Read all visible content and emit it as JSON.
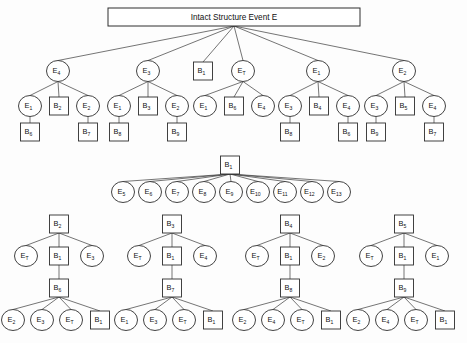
{
  "diagram": {
    "title": "Intact Structure Event E",
    "title_box": {
      "x": 108,
      "y": 8,
      "width": 252,
      "height": 18
    },
    "colors": {
      "background": "#fdfdfd",
      "node_fill": "#ffffff",
      "node_stroke": "#2e2e2e",
      "edge_stroke": "#3a3a3a",
      "text": "#111111"
    },
    "geometry": {
      "circle_rx": 11.5,
      "circle_ry": 10.5,
      "box_width": 19,
      "box_height": 18
    },
    "nodes": [
      {
        "id": "root",
        "shape": "box",
        "base": "E",
        "sub": "",
        "label": "Intact Structure Event E",
        "x": 234,
        "y": 17
      },
      {
        "id": "t1",
        "shape": "circle",
        "base": "E",
        "sub": "4",
        "x": 58,
        "y": 71
      },
      {
        "id": "t2",
        "shape": "circle",
        "base": "E",
        "sub": "3",
        "x": 148,
        "y": 71
      },
      {
        "id": "t3",
        "shape": "box",
        "base": "B",
        "sub": "1",
        "x": 203,
        "y": 71
      },
      {
        "id": "t4",
        "shape": "circle",
        "base": "E",
        "sub": "T",
        "x": 243,
        "y": 71
      },
      {
        "id": "t5",
        "shape": "circle",
        "base": "E",
        "sub": "1",
        "x": 318,
        "y": 71
      },
      {
        "id": "t6",
        "shape": "circle",
        "base": "E",
        "sub": "2",
        "x": 404,
        "y": 71
      },
      {
        "id": "a1",
        "shape": "circle",
        "base": "E",
        "sub": "1",
        "x": 30,
        "y": 106
      },
      {
        "id": "a2",
        "shape": "box",
        "base": "B",
        "sub": "2",
        "x": 59,
        "y": 106
      },
      {
        "id": "a3",
        "shape": "circle",
        "base": "E",
        "sub": "2",
        "x": 88,
        "y": 106
      },
      {
        "id": "a1c",
        "shape": "box",
        "base": "B",
        "sub": "6",
        "x": 30,
        "y": 132
      },
      {
        "id": "a3c",
        "shape": "box",
        "base": "B",
        "sub": "7",
        "x": 88,
        "y": 132
      },
      {
        "id": "b1",
        "shape": "circle",
        "base": "E",
        "sub": "1",
        "x": 119,
        "y": 106
      },
      {
        "id": "b2",
        "shape": "box",
        "base": "B",
        "sub": "3",
        "x": 148,
        "y": 106
      },
      {
        "id": "b3",
        "shape": "circle",
        "base": "E",
        "sub": "2",
        "x": 177,
        "y": 106
      },
      {
        "id": "b1c",
        "shape": "box",
        "base": "B",
        "sub": "8",
        "x": 119,
        "y": 132
      },
      {
        "id": "b3c",
        "shape": "box",
        "base": "B",
        "sub": "9",
        "x": 177,
        "y": 132
      },
      {
        "id": "c1",
        "shape": "circle",
        "base": "E",
        "sub": "1",
        "x": 205,
        "y": 106
      },
      {
        "id": "c2",
        "shape": "box",
        "base": "B",
        "sub": "6",
        "x": 234,
        "y": 106
      },
      {
        "id": "c3",
        "shape": "circle",
        "base": "E",
        "sub": "4",
        "x": 263,
        "y": 106
      },
      {
        "id": "d1",
        "shape": "circle",
        "base": "E",
        "sub": "3",
        "x": 290,
        "y": 106
      },
      {
        "id": "d2",
        "shape": "box",
        "base": "B",
        "sub": "4",
        "x": 319,
        "y": 106
      },
      {
        "id": "d3",
        "shape": "circle",
        "base": "E",
        "sub": "4",
        "x": 348,
        "y": 106
      },
      {
        "id": "d1c",
        "shape": "box",
        "base": "B",
        "sub": "8",
        "x": 290,
        "y": 132
      },
      {
        "id": "d3c",
        "shape": "box",
        "base": "B",
        "sub": "6",
        "x": 348,
        "y": 132
      },
      {
        "id": "f1",
        "shape": "circle",
        "base": "E",
        "sub": "3",
        "x": 376,
        "y": 106
      },
      {
        "id": "f2",
        "shape": "box",
        "base": "B",
        "sub": "5",
        "x": 405,
        "y": 106
      },
      {
        "id": "f3",
        "shape": "circle",
        "base": "E",
        "sub": "4",
        "x": 434,
        "y": 106
      },
      {
        "id": "f1c",
        "shape": "box",
        "base": "B",
        "sub": "9",
        "x": 376,
        "y": 132
      },
      {
        "id": "f3c",
        "shape": "box",
        "base": "B",
        "sub": "7",
        "x": 434,
        "y": 132
      },
      {
        "id": "m0",
        "shape": "box",
        "base": "B",
        "sub": "1",
        "x": 230,
        "y": 165
      },
      {
        "id": "m1",
        "shape": "circle",
        "base": "E",
        "sub": "5",
        "x": 123,
        "y": 192
      },
      {
        "id": "m2",
        "shape": "circle",
        "base": "E",
        "sub": "6",
        "x": 150,
        "y": 192
      },
      {
        "id": "m3",
        "shape": "circle",
        "base": "E",
        "sub": "7",
        "x": 177,
        "y": 192
      },
      {
        "id": "m4",
        "shape": "circle",
        "base": "E",
        "sub": "8",
        "x": 204,
        "y": 192
      },
      {
        "id": "m5",
        "shape": "circle",
        "base": "E",
        "sub": "9",
        "x": 231,
        "y": 192
      },
      {
        "id": "m6",
        "shape": "circle",
        "base": "E",
        "sub": "10",
        "x": 258,
        "y": 192
      },
      {
        "id": "m7",
        "shape": "circle",
        "base": "E",
        "sub": "11",
        "x": 285,
        "y": 192
      },
      {
        "id": "m8",
        "shape": "circle",
        "base": "E",
        "sub": "12",
        "x": 312,
        "y": 192
      },
      {
        "id": "m9",
        "shape": "circle",
        "base": "E",
        "sub": "13",
        "x": 339,
        "y": 192
      },
      {
        "id": "g1r",
        "shape": "box",
        "base": "B",
        "sub": "2",
        "x": 59,
        "y": 224
      },
      {
        "id": "g1a",
        "shape": "circle",
        "base": "E",
        "sub": "T",
        "x": 26,
        "y": 256
      },
      {
        "id": "g1b",
        "shape": "box",
        "base": "B",
        "sub": "1",
        "x": 59,
        "y": 256
      },
      {
        "id": "g1c",
        "shape": "circle",
        "base": "E",
        "sub": "3",
        "x": 92,
        "y": 256
      },
      {
        "id": "g1m",
        "shape": "box",
        "base": "B",
        "sub": "6",
        "x": 59,
        "y": 288
      },
      {
        "id": "g1l1",
        "shape": "circle",
        "base": "E",
        "sub": "2",
        "x": 13,
        "y": 320
      },
      {
        "id": "g1l2",
        "shape": "circle",
        "base": "E",
        "sub": "3",
        "x": 42,
        "y": 320
      },
      {
        "id": "g1l3",
        "shape": "circle",
        "base": "E",
        "sub": "T",
        "x": 71,
        "y": 320
      },
      {
        "id": "g1l4",
        "shape": "box",
        "base": "B",
        "sub": "1",
        "x": 100,
        "y": 320
      },
      {
        "id": "g2r",
        "shape": "box",
        "base": "B",
        "sub": "3",
        "x": 172,
        "y": 224
      },
      {
        "id": "g2a",
        "shape": "circle",
        "base": "E",
        "sub": "T",
        "x": 139,
        "y": 256
      },
      {
        "id": "g2b",
        "shape": "box",
        "base": "B",
        "sub": "1",
        "x": 172,
        "y": 256
      },
      {
        "id": "g2c",
        "shape": "circle",
        "base": "E",
        "sub": "4",
        "x": 205,
        "y": 256
      },
      {
        "id": "g2m",
        "shape": "box",
        "base": "B",
        "sub": "7",
        "x": 172,
        "y": 288
      },
      {
        "id": "g2l1",
        "shape": "circle",
        "base": "E",
        "sub": "1",
        "x": 126,
        "y": 320
      },
      {
        "id": "g2l2",
        "shape": "circle",
        "base": "E",
        "sub": "3",
        "x": 155,
        "y": 320
      },
      {
        "id": "g2l3",
        "shape": "circle",
        "base": "E",
        "sub": "T",
        "x": 184,
        "y": 320
      },
      {
        "id": "g2l4",
        "shape": "box",
        "base": "B",
        "sub": "1",
        "x": 213,
        "y": 320
      },
      {
        "id": "g3r",
        "shape": "box",
        "base": "B",
        "sub": "4",
        "x": 290,
        "y": 224
      },
      {
        "id": "g3a",
        "shape": "circle",
        "base": "E",
        "sub": "T",
        "x": 257,
        "y": 256
      },
      {
        "id": "g3b",
        "shape": "box",
        "base": "B",
        "sub": "1",
        "x": 290,
        "y": 256
      },
      {
        "id": "g3c",
        "shape": "circle",
        "base": "E",
        "sub": "2",
        "x": 323,
        "y": 256
      },
      {
        "id": "g3m",
        "shape": "box",
        "base": "B",
        "sub": "8",
        "x": 290,
        "y": 288
      },
      {
        "id": "g3l1",
        "shape": "circle",
        "base": "E",
        "sub": "2",
        "x": 244,
        "y": 320
      },
      {
        "id": "g3l2",
        "shape": "circle",
        "base": "E",
        "sub": "4",
        "x": 273,
        "y": 320
      },
      {
        "id": "g3l3",
        "shape": "circle",
        "base": "E",
        "sub": "T",
        "x": 302,
        "y": 320
      },
      {
        "id": "g3l4",
        "shape": "box",
        "base": "B",
        "sub": "1",
        "x": 331,
        "y": 320
      },
      {
        "id": "g4r",
        "shape": "box",
        "base": "B",
        "sub": "5",
        "x": 404,
        "y": 224
      },
      {
        "id": "g4a",
        "shape": "circle",
        "base": "E",
        "sub": "T",
        "x": 371,
        "y": 256
      },
      {
        "id": "g4b",
        "shape": "box",
        "base": "B",
        "sub": "1",
        "x": 404,
        "y": 256
      },
      {
        "id": "g4c",
        "shape": "circle",
        "base": "E",
        "sub": "1",
        "x": 437,
        "y": 256
      },
      {
        "id": "g4m",
        "shape": "box",
        "base": "B",
        "sub": "9",
        "x": 404,
        "y": 288
      },
      {
        "id": "g4l1",
        "shape": "circle",
        "base": "E",
        "sub": "2",
        "x": 358,
        "y": 320
      },
      {
        "id": "g4l2",
        "shape": "circle",
        "base": "E",
        "sub": "4",
        "x": 387,
        "y": 320
      },
      {
        "id": "g4l3",
        "shape": "circle",
        "base": "E",
        "sub": "T",
        "x": 416,
        "y": 320
      },
      {
        "id": "g4l4",
        "shape": "box",
        "base": "B",
        "sub": "1",
        "x": 445,
        "y": 320
      }
    ],
    "edges": [
      [
        "root",
        "t1"
      ],
      [
        "root",
        "t2"
      ],
      [
        "root",
        "t3"
      ],
      [
        "root",
        "t4"
      ],
      [
        "root",
        "t5"
      ],
      [
        "root",
        "t6"
      ],
      [
        "t1",
        "a1"
      ],
      [
        "t1",
        "a2"
      ],
      [
        "t1",
        "a3"
      ],
      [
        "a1",
        "a1c"
      ],
      [
        "a3",
        "a3c"
      ],
      [
        "t2",
        "b1"
      ],
      [
        "t2",
        "b2"
      ],
      [
        "t2",
        "b3"
      ],
      [
        "b1",
        "b1c"
      ],
      [
        "b3",
        "b3c"
      ],
      [
        "t4",
        "c1"
      ],
      [
        "t4",
        "c2"
      ],
      [
        "t4",
        "c3"
      ],
      [
        "t5",
        "d1"
      ],
      [
        "t5",
        "d2"
      ],
      [
        "t5",
        "d3"
      ],
      [
        "d1",
        "d1c"
      ],
      [
        "d3",
        "d3c"
      ],
      [
        "t6",
        "f1"
      ],
      [
        "t6",
        "f2"
      ],
      [
        "t6",
        "f3"
      ],
      [
        "f1",
        "f1c"
      ],
      [
        "f3",
        "f3c"
      ],
      [
        "m0",
        "m1"
      ],
      [
        "m0",
        "m2"
      ],
      [
        "m0",
        "m3"
      ],
      [
        "m0",
        "m4"
      ],
      [
        "m0",
        "m5"
      ],
      [
        "m0",
        "m6"
      ],
      [
        "m0",
        "m7"
      ],
      [
        "m0",
        "m8"
      ],
      [
        "m0",
        "m9"
      ],
      [
        "g1r",
        "g1a"
      ],
      [
        "g1r",
        "g1b"
      ],
      [
        "g1r",
        "g1c"
      ],
      [
        "g1b",
        "g1m"
      ],
      [
        "g1m",
        "g1l1"
      ],
      [
        "g1m",
        "g1l2"
      ],
      [
        "g1m",
        "g1l3"
      ],
      [
        "g1m",
        "g1l4"
      ],
      [
        "g2r",
        "g2a"
      ],
      [
        "g2r",
        "g2b"
      ],
      [
        "g2r",
        "g2c"
      ],
      [
        "g2b",
        "g2m"
      ],
      [
        "g2m",
        "g2l1"
      ],
      [
        "g2m",
        "g2l2"
      ],
      [
        "g2m",
        "g2l3"
      ],
      [
        "g2m",
        "g2l4"
      ],
      [
        "g3r",
        "g3a"
      ],
      [
        "g3r",
        "g3b"
      ],
      [
        "g3r",
        "g3c"
      ],
      [
        "g3b",
        "g3m"
      ],
      [
        "g3m",
        "g3l1"
      ],
      [
        "g3m",
        "g3l2"
      ],
      [
        "g3m",
        "g3l3"
      ],
      [
        "g3m",
        "g3l4"
      ],
      [
        "g4r",
        "g4a"
      ],
      [
        "g4r",
        "g4b"
      ],
      [
        "g4r",
        "g4c"
      ],
      [
        "g4b",
        "g4m"
      ],
      [
        "g4m",
        "g4l1"
      ],
      [
        "g4m",
        "g4l2"
      ],
      [
        "g4m",
        "g4l3"
      ],
      [
        "g4m",
        "g4l4"
      ]
    ]
  }
}
